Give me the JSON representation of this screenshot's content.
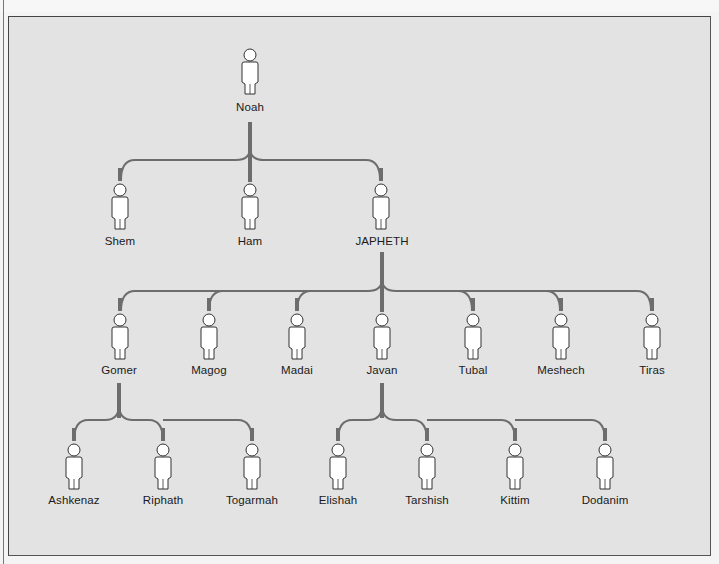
{
  "diagram": {
    "title": "",
    "colors": {
      "background": "#e3e3e3",
      "connector": "#6d6d6d",
      "figure_fill": "#ffffff",
      "figure_stroke": "#333333",
      "text": "#1a1a1a"
    },
    "generations": [
      {
        "level": 0,
        "people": [
          {
            "id": "noah",
            "name": "Noah",
            "x": 250
          }
        ]
      },
      {
        "level": 1,
        "parent": "noah",
        "people": [
          {
            "id": "shem",
            "name": "Shem",
            "x": 119
          },
          {
            "id": "ham",
            "name": "Ham",
            "x": 250
          },
          {
            "id": "japheth",
            "name": "JAPHETH",
            "x": 382
          }
        ]
      },
      {
        "level": 2,
        "parent": "japheth",
        "people": [
          {
            "id": "gomer",
            "name": "Gomer",
            "x": 119
          },
          {
            "id": "magog",
            "name": "Magog",
            "x": 209
          },
          {
            "id": "madai",
            "name": "Madai",
            "x": 297
          },
          {
            "id": "javan",
            "name": "Javan",
            "x": 382
          },
          {
            "id": "tubal",
            "name": "Tubal",
            "x": 472
          },
          {
            "id": "meshech",
            "name": "Meshech",
            "x": 560
          },
          {
            "id": "tiras",
            "name": "Tiras",
            "x": 651
          }
        ]
      },
      {
        "level": 3,
        "groups": [
          {
            "parent": "gomer",
            "people": [
              {
                "id": "ashkenaz",
                "name": "Ashkenaz",
                "x": 74
              },
              {
                "id": "riphath",
                "name": "Riphath",
                "x": 163
              },
              {
                "id": "togarmah",
                "name": "Togarmah",
                "x": 252
              }
            ]
          },
          {
            "parent": "javan",
            "people": [
              {
                "id": "elishah",
                "name": "Elishah",
                "x": 338
              },
              {
                "id": "tarshish",
                "name": "Tarshish",
                "x": 427
              },
              {
                "id": "kittim",
                "name": "Kittim",
                "x": 515
              },
              {
                "id": "dodanim",
                "name": "Dodanim",
                "x": 605
              }
            ]
          }
        ]
      }
    ]
  },
  "labels": {
    "noah": "Noah",
    "shem": "Shem",
    "ham": "Ham",
    "japheth": "JAPHETH",
    "gomer": "Gomer",
    "magog": "Magog",
    "madai": "Madai",
    "javan": "Javan",
    "tubal": "Tubal",
    "meshech": "Meshech",
    "tiras": "Tiras",
    "ashkenaz": "Ashkenaz",
    "riphath": "Riphath",
    "togarmah": "Togarmah",
    "elishah": "Elishah",
    "tarshish": "Tarshish",
    "kittim": "Kittim",
    "dodanim": "Dodanim"
  }
}
